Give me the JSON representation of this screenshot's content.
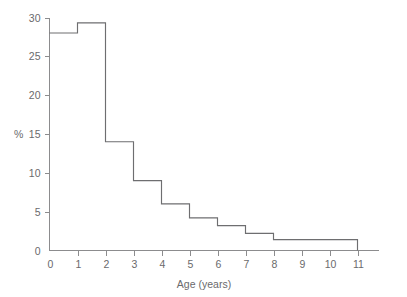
{
  "chart_data": {
    "type": "bar",
    "title": "",
    "subtitle": "",
    "xlabel": "Age (years)",
    "ylabel": "%",
    "xlim": [
      0,
      11.75
    ],
    "ylim": [
      0,
      30
    ],
    "grid": false,
    "legend": null,
    "style": "step-histogram",
    "bin_edges": [
      0,
      1,
      2,
      3,
      4,
      5,
      6,
      7,
      8,
      9,
      10,
      11
    ],
    "categories": [
      "0-1",
      "1-2",
      "2-3",
      "3-4",
      "4-5",
      "5-6",
      "6-7",
      "7-8",
      "8-9",
      "9-10",
      "10-11"
    ],
    "values": [
      28,
      29.3,
      14,
      9,
      6,
      4.2,
      3.2,
      2.2,
      1.4,
      1.4,
      1.4
    ],
    "x_ticks": [
      0,
      1,
      2,
      3,
      4,
      5,
      6,
      7,
      8,
      9,
      10,
      11
    ],
    "x_tick_labels": [
      "0",
      "1",
      "2",
      "3",
      "4",
      "5",
      "6",
      "7",
      "8",
      "9",
      "10",
      "11"
    ],
    "y_ticks": [
      0,
      5,
      10,
      15,
      20,
      25,
      30
    ],
    "y_tick_labels": [
      "0",
      "5",
      "10",
      "15",
      "20",
      "25",
      "30"
    ],
    "line_color": "#6e6e70",
    "axis_color": "#8c8c8e",
    "text_color": "#6a6a6c",
    "background": "#ffffff"
  },
  "axes": {
    "x_axis_name": "Age (years)",
    "y_axis_name": "%"
  }
}
